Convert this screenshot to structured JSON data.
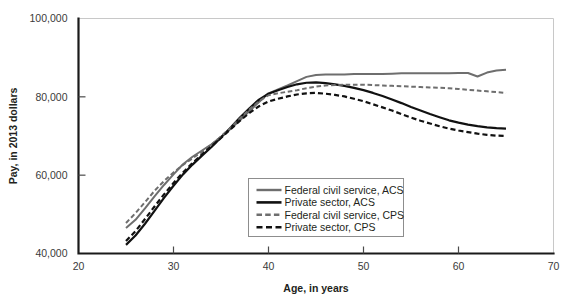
{
  "chart_data": {
    "type": "line",
    "title": "",
    "xlabel": "Age, in years",
    "ylabel": "Pay, in 2013 dollars",
    "xlim": [
      20,
      70
    ],
    "ylim": [
      40000,
      100000
    ],
    "xticks": [
      20,
      30,
      40,
      50,
      60,
      70
    ],
    "yticks": [
      40000,
      60000,
      80000,
      100000
    ],
    "xtick_labels": [
      "20",
      "30",
      "40",
      "50",
      "60",
      "70"
    ],
    "ytick_labels": [
      "40,000",
      "60,000",
      "80,000",
      "100,000"
    ],
    "grid": false,
    "legend_position": "lower-center-right",
    "series": [
      {
        "name": "Federal civil service, ACS",
        "color": "#6e6e6e",
        "style": "solid",
        "width": 2.0,
        "x": [
          25,
          26,
          27,
          28,
          29,
          30,
          31,
          32,
          33,
          34,
          35,
          36,
          37,
          38,
          39,
          40,
          41,
          42,
          43,
          44,
          45,
          46,
          47,
          48,
          49,
          50,
          51,
          52,
          53,
          54,
          55,
          56,
          57,
          58,
          59,
          60,
          61,
          62,
          63,
          64,
          65
        ],
        "y": [
          46500,
          48600,
          51500,
          54600,
          57500,
          60200,
          62800,
          64700,
          66300,
          67900,
          69800,
          71800,
          74000,
          76400,
          78700,
          80900,
          81900,
          82900,
          84000,
          85100,
          85600,
          85700,
          85700,
          85700,
          85800,
          85800,
          85800,
          85800,
          85900,
          86000,
          86000,
          86000,
          86000,
          86000,
          86000,
          86100,
          86100,
          85200,
          86200,
          86700,
          86900
        ]
      },
      {
        "name": "Private sector, ACS",
        "color": "#111111",
        "style": "solid",
        "width": 2.2,
        "x": [
          25,
          26,
          27,
          28,
          29,
          30,
          31,
          32,
          33,
          34,
          35,
          36,
          37,
          38,
          39,
          40,
          41,
          42,
          43,
          44,
          45,
          46,
          47,
          48,
          49,
          50,
          51,
          52,
          53,
          54,
          55,
          56,
          57,
          58,
          59,
          60,
          61,
          62,
          63,
          64,
          65
        ],
        "y": [
          42200,
          44600,
          47600,
          50900,
          54200,
          57300,
          60200,
          62700,
          65000,
          67200,
          69600,
          72100,
          74700,
          77100,
          79300,
          80800,
          81700,
          82500,
          83200,
          83600,
          83700,
          83500,
          83200,
          82800,
          82300,
          81700,
          81000,
          80200,
          79300,
          78400,
          77400,
          76500,
          75600,
          74800,
          74000,
          73400,
          72900,
          72500,
          72200,
          72000,
          71900
        ]
      },
      {
        "name": "Federal civil service, CPS",
        "color": "#6e6e6e",
        "style": "dashed",
        "width": 2.0,
        "x": [
          25,
          26,
          27,
          28,
          29,
          30,
          31,
          32,
          33,
          34,
          35,
          36,
          37,
          38,
          39,
          40,
          41,
          42,
          43,
          44,
          45,
          46,
          47,
          48,
          49,
          50,
          51,
          52,
          53,
          54,
          55,
          56,
          57,
          58,
          59,
          60,
          61,
          62,
          63,
          64,
          65
        ],
        "y": [
          47800,
          50300,
          53100,
          56000,
          58500,
          60700,
          62600,
          64300,
          66000,
          67800,
          69900,
          72100,
          74500,
          76800,
          78900,
          80400,
          80900,
          81300,
          81700,
          82200,
          82600,
          82900,
          83000,
          83100,
          83100,
          83100,
          83000,
          82900,
          82800,
          82700,
          82600,
          82500,
          82400,
          82300,
          82200,
          82000,
          81800,
          81600,
          81400,
          81200,
          81000
        ]
      },
      {
        "name": "Private sector, CPS",
        "color": "#111111",
        "style": "dashed",
        "width": 2.2,
        "x": [
          25,
          26,
          27,
          28,
          29,
          30,
          31,
          32,
          33,
          34,
          35,
          36,
          37,
          38,
          39,
          40,
          41,
          42,
          43,
          44,
          45,
          46,
          47,
          48,
          49,
          50,
          51,
          52,
          53,
          54,
          55,
          56,
          57,
          58,
          59,
          60,
          61,
          62,
          63,
          64,
          65
        ],
        "y": [
          43200,
          45700,
          48800,
          52000,
          55100,
          58000,
          60700,
          63100,
          65300,
          67400,
          69500,
          71700,
          73900,
          75900,
          77600,
          78800,
          79500,
          80100,
          80600,
          80900,
          81000,
          80800,
          80500,
          80100,
          79500,
          78900,
          78100,
          77300,
          76500,
          75600,
          74700,
          73900,
          73200,
          72500,
          71900,
          71400,
          71000,
          70600,
          70300,
          70100,
          70000
        ]
      }
    ]
  },
  "legend": {
    "items": [
      {
        "label": "Federal civil service, ACS"
      },
      {
        "label": "Private sector, ACS"
      },
      {
        "label": "Federal civil service, CPS"
      },
      {
        "label": "Private sector, CPS"
      }
    ]
  }
}
